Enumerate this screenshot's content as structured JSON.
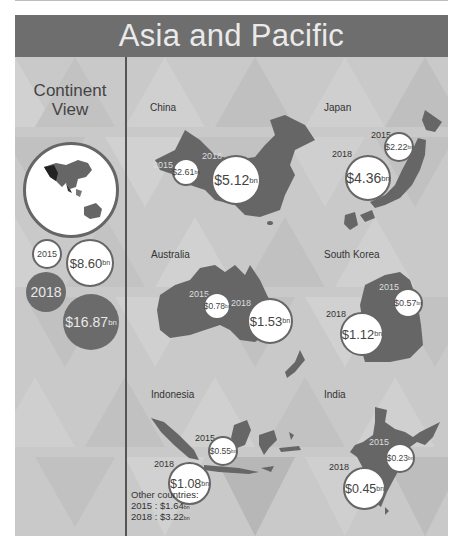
{
  "header": {
    "title": "Asia and Pacific"
  },
  "continent": {
    "title_line1": "Continent",
    "title_line2": "View",
    "year_2015": "2015",
    "value_2015": "$8.60",
    "year_2018": "2018",
    "value_2018": "$16.87",
    "unit": "bn"
  },
  "countries": [
    {
      "name": "China",
      "y2015": "2015",
      "v2015": "$2.61",
      "y2018": "2018",
      "v2018": "$5.12",
      "unit": "bn"
    },
    {
      "name": "Japan",
      "y2015": "2015",
      "v2015": "$2.22",
      "y2018": "2018",
      "v2018": "$4.36",
      "unit": "bn"
    },
    {
      "name": "Australia",
      "y2015": "2015",
      "v2015": "$0.78",
      "y2018": "2018",
      "v2018": "$1.53",
      "unit": "bn"
    },
    {
      "name": "South Korea",
      "y2015": "2015",
      "v2015": "$0.57",
      "y2018": "2018",
      "v2018": "$1.12",
      "unit": "bn"
    },
    {
      "name": "Indonesia",
      "y2015": "2015",
      "v2015": "$0.55",
      "y2018": "2018",
      "v2018": "$1.08",
      "unit": "bn"
    },
    {
      "name": "India",
      "y2015": "2015",
      "v2015": "$0.23",
      "y2018": "2018",
      "v2018": "$0.45",
      "unit": "bn"
    }
  ],
  "other": {
    "label": "Other countries:",
    "line_2015": "2015 : $1.64",
    "line_2018": "2018 : $3.22",
    "unit": "bn"
  },
  "colors": {
    "header": "#6e6e6e",
    "background": "#c9c9c9",
    "map": "#666666",
    "bubble": "#ffffff",
    "dark_bubble": "#6b6b6b"
  }
}
